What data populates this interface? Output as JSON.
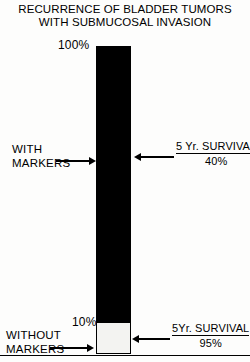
{
  "title": {
    "line1": "RECURRENCE OF BLADDER TUMORS",
    "line2": "WITH SUBMUCOSAL INVASION"
  },
  "axis": {
    "top_label": "100%",
    "split_label": "10%"
  },
  "annotations": {
    "left_upper_line1": "WITH",
    "left_upper_line2": "MARKERS",
    "left_lower_line1": "WITHOUT",
    "left_lower_line2": "MARKERS",
    "right_upper_line1": "5 Yr. SURVIVAL",
    "right_upper_line2": "40%",
    "right_lower_line1": "5Yr. SURVIVAL",
    "right_lower_line2": "95%"
  },
  "colors": {
    "bar_filled": "#000000",
    "bar_empty": "#f3f3f1",
    "ink": "#000000",
    "paper": "#fdfdfc"
  },
  "chart_data": {
    "type": "bar",
    "title": "RECURRENCE OF BLADDER TUMORS WITH SUBMUCOSAL INVASION",
    "xlabel": "",
    "ylabel": "",
    "ylim": [
      0,
      100
    ],
    "grid": false,
    "legend_position": "none",
    "categories": [
      "WITH MARKERS",
      "WITHOUT MARKERS"
    ],
    "values": [
      90,
      10
    ],
    "stacked": true,
    "segments": [
      {
        "name": "WITH MARKERS",
        "range": [
          10,
          100
        ],
        "top_value": 100,
        "bottom_value": 10,
        "percent_span": 90,
        "fill": "#000000",
        "annotation": "5 Yr. SURVIVAL 40%",
        "survival_percent": 40
      },
      {
        "name": "WITHOUT MARKERS",
        "range": [
          0,
          10
        ],
        "top_value": 10,
        "bottom_value": 0,
        "percent_span": 10,
        "fill": "#f3f3f1",
        "annotation": "5Yr. SURVIVAL 95%",
        "survival_percent": 95
      }
    ],
    "tick_labels": [
      "100%",
      "10%"
    ],
    "annotations_text": [
      "WITH MARKERS",
      "WITHOUT MARKERS",
      "5 Yr. SURVIVAL 40%",
      "5Yr. SURVIVAL 95%"
    ]
  }
}
